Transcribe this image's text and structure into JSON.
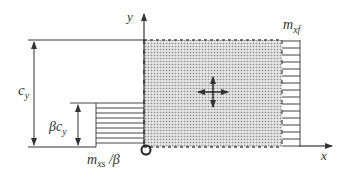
{
  "diagram": {
    "axes": {
      "x_label": "x",
      "y_label": "y"
    },
    "dimensions": {
      "full_height_label": "c",
      "full_height_sub": "y",
      "partial_height_label": "βc",
      "partial_height_sub": "y"
    },
    "moments": {
      "right_label_main": "m",
      "right_label_sub": "xf",
      "left_label_main": "m",
      "left_label_sub": "xs",
      "left_label_suffix": " /β"
    },
    "colors": {
      "line": "#333333",
      "shade": "#bdbdbd",
      "background": "#ffffff"
    }
  }
}
